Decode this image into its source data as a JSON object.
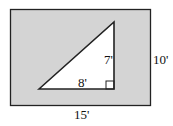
{
  "diagram": {
    "type": "geometry-area",
    "rectangle": {
      "width_label": "15'",
      "height_label": "10'",
      "fill": "#d4d4d4",
      "stroke": "#222222"
    },
    "triangle": {
      "base_label": "8'",
      "height_label": "7'",
      "fill": "#ffffff",
      "right_angle": true
    }
  }
}
